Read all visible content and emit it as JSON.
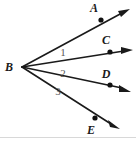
{
  "figure": {
    "kind": "geometry-angle-diagram",
    "background_color": "#ffffff",
    "line_color": "#1a1a1a",
    "label_color": "#1a1a1a",
    "angle_label_color": "#5a5a5a",
    "bottom_rule_color": "#d8d8d8",
    "width": 136,
    "height": 142
  },
  "vertex": {
    "label": "B",
    "x": 22,
    "y": 67,
    "label_x": 9,
    "label_y": 71
  },
  "rays": [
    {
      "label": "A",
      "dot_x": 101,
      "dot_y": 20,
      "tip_x": 129,
      "tip_y": 10,
      "label_x": 94,
      "label_y": 12
    },
    {
      "label": "C",
      "dot_x": 110,
      "dot_y": 52,
      "tip_x": 132,
      "tip_y": 50,
      "label_x": 105,
      "label_y": 44
    },
    {
      "label": "D",
      "dot_x": 110,
      "dot_y": 85,
      "tip_x": 130,
      "tip_y": 91,
      "label_x": 105,
      "label_y": 78
    },
    {
      "label": "E",
      "dot_x": 95,
      "dot_y": 118,
      "tip_x": 119,
      "tip_y": 128,
      "label_x": 91,
      "label_y": 133
    }
  ],
  "angles": [
    {
      "label": "1",
      "x": 63,
      "y": 55
    },
    {
      "label": "2",
      "x": 63,
      "y": 76
    },
    {
      "label": "3",
      "x": 58,
      "y": 94
    }
  ]
}
